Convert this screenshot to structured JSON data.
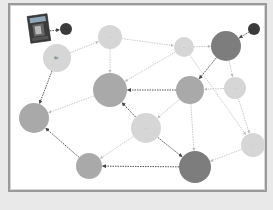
{
  "diagram": {
    "type": "concept-map",
    "colors": {
      "background": "#e9e9e9",
      "canvas": "#ffffff",
      "frame": "#9a9a9a",
      "node_light": "#d6d6d6",
      "node_medium": "#a9a9a9",
      "node_dark": "#7d7d7d",
      "node_black": "#3a3a3a",
      "edge_dark": "#555555",
      "edge_light": "#bdbdbd"
    },
    "book_cover": {
      "label": "book-cover"
    },
    "nodes": [
      {
        "id": "start",
        "label": "入口",
        "cx": 66,
        "cy": 29,
        "r": 6,
        "tone": "black"
      },
      {
        "id": "A",
        "label": "用户...",
        "cx": 57,
        "cy": 58,
        "r": 14,
        "tone": "light"
      },
      {
        "id": "B",
        "label": "...",
        "cx": 110,
        "cy": 37,
        "r": 12,
        "tone": "light"
      },
      {
        "id": "C",
        "label": "...",
        "cx": 110,
        "cy": 90,
        "r": 17,
        "tone": "medium"
      },
      {
        "id": "D",
        "label": "...",
        "cx": 184,
        "cy": 47,
        "r": 10,
        "tone": "light"
      },
      {
        "id": "E",
        "label": "...",
        "cx": 226,
        "cy": 46,
        "r": 15,
        "tone": "dark"
      },
      {
        "id": "end",
        "label": "出口",
        "cx": 254,
        "cy": 29,
        "r": 6,
        "tone": "black"
      },
      {
        "id": "F",
        "label": "...",
        "cx": 190,
        "cy": 90,
        "r": 14,
        "tone": "medium"
      },
      {
        "id": "G",
        "label": "...",
        "cx": 235,
        "cy": 88,
        "r": 11,
        "tone": "light"
      },
      {
        "id": "H",
        "label": "...",
        "cx": 34,
        "cy": 118,
        "r": 15,
        "tone": "medium"
      },
      {
        "id": "I",
        "label": "...",
        "cx": 146,
        "cy": 128,
        "r": 15,
        "tone": "light"
      },
      {
        "id": "J",
        "label": "...",
        "cx": 89,
        "cy": 166,
        "r": 13,
        "tone": "medium"
      },
      {
        "id": "K",
        "label": "...",
        "cx": 195,
        "cy": 167,
        "r": 16,
        "tone": "dark"
      },
      {
        "id": "L",
        "label": "...",
        "cx": 253,
        "cy": 145,
        "r": 12,
        "tone": "light"
      }
    ],
    "edges": [
      {
        "from": "book",
        "to": "start",
        "style": "dark",
        "label": ""
      },
      {
        "from": "A",
        "to": "B",
        "style": "light",
        "label": "..."
      },
      {
        "from": "A",
        "to": "H",
        "style": "dark",
        "label": "..."
      },
      {
        "from": "B",
        "to": "C",
        "style": "light",
        "label": "..."
      },
      {
        "from": "B",
        "to": "D",
        "style": "light",
        "label": "..."
      },
      {
        "from": "D",
        "to": "E",
        "style": "light",
        "label": "..."
      },
      {
        "from": "end",
        "to": "E",
        "style": "dark",
        "label": ""
      },
      {
        "from": "E",
        "to": "F",
        "style": "dark",
        "label": "..."
      },
      {
        "from": "E",
        "to": "G",
        "style": "light",
        "label": "..."
      },
      {
        "from": "D",
        "to": "C",
        "style": "light",
        "label": "..."
      },
      {
        "from": "F",
        "to": "C",
        "style": "dark",
        "label": "..."
      },
      {
        "from": "G",
        "to": "F",
        "style": "light",
        "label": "..."
      },
      {
        "from": "G",
        "to": "L",
        "style": "light",
        "label": "..."
      },
      {
        "from": "C",
        "to": "H",
        "style": "light",
        "label": "..."
      },
      {
        "from": "I",
        "to": "C",
        "style": "dark",
        "label": "..."
      },
      {
        "from": "I",
        "to": "K",
        "style": "dark",
        "label": "..."
      },
      {
        "from": "F",
        "to": "I",
        "style": "light",
        "label": "..."
      },
      {
        "from": "F",
        "to": "K",
        "style": "light",
        "label": "..."
      },
      {
        "from": "D",
        "to": "L",
        "style": "light",
        "label": "..."
      },
      {
        "from": "J",
        "to": "H",
        "style": "dark",
        "label": "..."
      },
      {
        "from": "I",
        "to": "J",
        "style": "light",
        "label": "..."
      },
      {
        "from": "K",
        "to": "J",
        "style": "dark",
        "label": "..."
      },
      {
        "from": "L",
        "to": "K",
        "style": "light",
        "label": "..."
      }
    ]
  }
}
